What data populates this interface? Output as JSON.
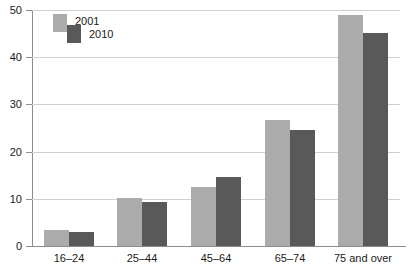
{
  "chart_data": {
    "type": "bar",
    "title": "",
    "subtitle": "",
    "xlabel": "",
    "ylabel": "",
    "ylim": [
      0,
      50
    ],
    "yticks": [
      0,
      10,
      20,
      30,
      40,
      50
    ],
    "grid": true,
    "legend_position": "top-left-inside",
    "categories": [
      "16–24",
      "25–44",
      "45–64",
      "65–74",
      "75 and over"
    ],
    "series": [
      {
        "name": "2001",
        "color": "#ababab",
        "values": [
          3.3,
          10.1,
          12.5,
          26.8,
          49.0
        ]
      },
      {
        "name": "2010",
        "color": "#595959",
        "values": [
          3.0,
          9.4,
          14.6,
          24.5,
          45.2
        ]
      }
    ]
  },
  "axis": {
    "y_tick_labels": [
      "0",
      "10",
      "20",
      "30",
      "40",
      "50"
    ],
    "x_tick_labels": [
      "16–24",
      "25–44",
      "45–64",
      "65–74",
      "75 and over"
    ]
  },
  "legend": {
    "entries": [
      {
        "label": "2001",
        "color": "#ababab"
      },
      {
        "label": "2010",
        "color": "#595959"
      }
    ]
  },
  "colors": {
    "series_2001": "#ababab",
    "series_2010": "#595959",
    "axis": "#8c8c8c",
    "gridline": "#d0d0d0",
    "text": "#1a1a1a",
    "background": "#ffffff"
  }
}
